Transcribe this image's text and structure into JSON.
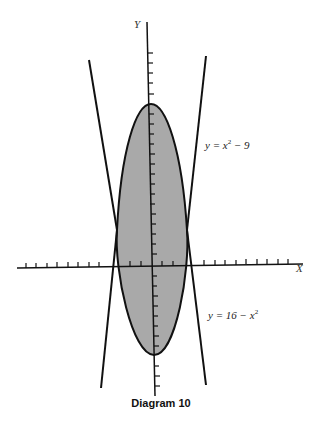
{
  "diagram": {
    "caption": "Diagram 10",
    "axes": {
      "x_label": "X",
      "y_label": "Y"
    },
    "curves": [
      {
        "id": "curve-a",
        "label_prefix": "y = x",
        "label_exp": "2",
        "label_suffix": " − 9"
      },
      {
        "id": "curve-b",
        "label_prefix": "y = 16 − x",
        "label_exp": "2",
        "label_suffix": ""
      }
    ],
    "shaded_region": {
      "fill": "#a9a9a9",
      "description": "region between the two parabolas"
    },
    "colors": {
      "stroke": "#111111",
      "fill": "#a9a9a9",
      "background": "#ffffff"
    }
  }
}
